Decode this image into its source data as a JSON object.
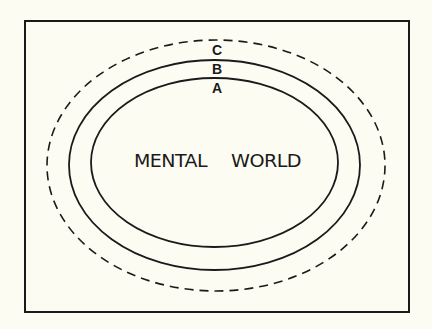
{
  "diagram": {
    "central_label": {
      "word1": "MENTAL",
      "word2": "WORLD"
    },
    "boundaries": [
      {
        "id": "A",
        "label": "A",
        "style": "solid",
        "position": "innermost"
      },
      {
        "id": "B",
        "label": "B",
        "style": "solid",
        "position": "middle"
      },
      {
        "id": "C",
        "label": "C",
        "style": "dashed",
        "position": "outermost"
      }
    ],
    "colors": {
      "background": "#fdfcf3",
      "stroke": "#1a1a1a"
    }
  }
}
